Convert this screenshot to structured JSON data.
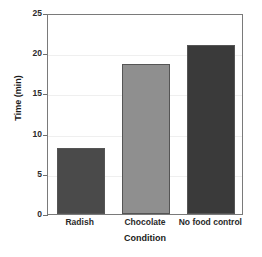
{
  "chart_data": {
    "type": "bar",
    "title": "",
    "categories": [
      "Radish",
      "Chocolate",
      "No food control"
    ],
    "values": [
      8.2,
      18.7,
      21.0
    ],
    "bar_colors": [
      "#4a4a4a",
      "#8f8f8f",
      "#3a3a3a"
    ],
    "xlabel": "Condition",
    "ylabel": "Time (min)",
    "ylim": [
      0,
      25
    ],
    "yticks": [
      0,
      5,
      10,
      15,
      20,
      25
    ],
    "ytick_labels": [
      "0",
      "5",
      "10",
      "15",
      "20",
      "25"
    ],
    "grid": true,
    "grid_color": "#efefef",
    "legend": "none",
    "frame_color": "#7a7a7a",
    "background": "#ffffff"
  }
}
